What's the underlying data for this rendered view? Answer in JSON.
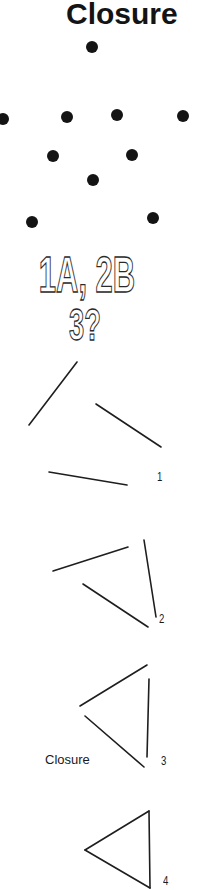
{
  "title": "Closure",
  "dots": {
    "color": "#141414",
    "radius": 6,
    "points": [
      {
        "x": 92,
        "y": 47
      },
      {
        "x": 3,
        "y": 119
      },
      {
        "x": 67,
        "y": 117
      },
      {
        "x": 117,
        "y": 115
      },
      {
        "x": 183,
        "y": 116
      },
      {
        "x": 53,
        "y": 156
      },
      {
        "x": 132,
        "y": 155
      },
      {
        "x": 93,
        "y": 180
      },
      {
        "x": 32,
        "y": 222
      },
      {
        "x": 153,
        "y": 218
      }
    ]
  },
  "puzzle": {
    "line1": "1A, 2B",
    "line2": "3?"
  },
  "figures": [
    {
      "label": "1",
      "label_pos": {
        "x": 157,
        "y": 470
      },
      "segments": [
        [
          77,
          362,
          29,
          425
        ],
        [
          96,
          404,
          161,
          447
        ],
        [
          49,
          472,
          127,
          485
        ]
      ]
    },
    {
      "label": "2",
      "label_pos": {
        "x": 159,
        "y": 612
      },
      "segments": [
        [
          53,
          571,
          128,
          547
        ],
        [
          144,
          540,
          156,
          617
        ],
        [
          83,
          584,
          148,
          627
        ]
      ]
    },
    {
      "label": "3",
      "label_pos": {
        "x": 161,
        "y": 754
      },
      "segments": [
        [
          80,
          706,
          147,
          665
        ],
        [
          149,
          679,
          147,
          757
        ],
        [
          85,
          716,
          144,
          767
        ]
      ]
    },
    {
      "label": "4",
      "label_pos": {
        "x": 163,
        "y": 874
      },
      "segments": [
        [
          85,
          850,
          149,
          811
        ],
        [
          149,
          811,
          150,
          888
        ],
        [
          150,
          888,
          85,
          850
        ]
      ]
    }
  ],
  "caption": "Closure",
  "line_color": "#1e1e1e"
}
